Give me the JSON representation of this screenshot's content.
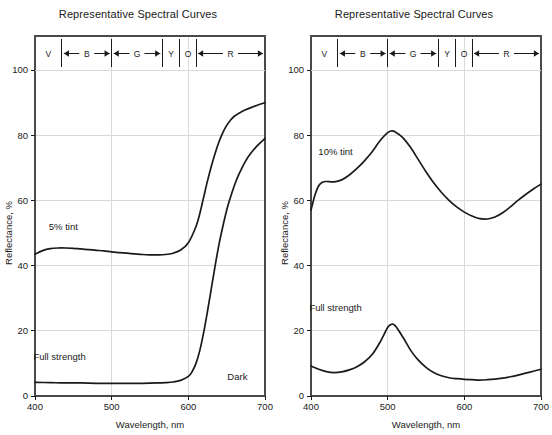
{
  "chart_data": [
    {
      "type": "line",
      "panel": "left",
      "title": "Representative Spectral Curves",
      "xlabel": "Wavelength, nm",
      "ylabel": "Reflectance, %",
      "xlim": [
        400,
        700
      ],
      "ylim": [
        0,
        100
      ],
      "xticks": [
        400,
        500,
        600,
        700
      ],
      "yticks": [
        0,
        20,
        40,
        60,
        80,
        100
      ],
      "grid": true,
      "legend_position": "inline-annotations",
      "annotations": [
        {
          "text": "5% tint",
          "x": 437,
          "y": 51
        },
        {
          "text": "Full strength",
          "x": 432,
          "y": 11
        },
        {
          "text": "Dark",
          "x": 664,
          "y": 5
        }
      ],
      "bands": [
        {
          "label": "V",
          "start": 400,
          "end": 435,
          "arrow": "right"
        },
        {
          "label": "B",
          "start": 435,
          "end": 500,
          "arrow": "both"
        },
        {
          "label": "G",
          "start": 500,
          "end": 566,
          "arrow": "both"
        },
        {
          "label": "Y",
          "start": 566,
          "end": 589,
          "arrow": "none"
        },
        {
          "label": "O",
          "start": 589,
          "end": 610,
          "arrow": "none"
        },
        {
          "label": "R",
          "start": 610,
          "end": 700,
          "arrow": "both"
        }
      ],
      "series": [
        {
          "name": "5% tint",
          "x": [
            400,
            410,
            420,
            430,
            440,
            450,
            460,
            470,
            480,
            490,
            500,
            510,
            520,
            530,
            540,
            550,
            560,
            570,
            580,
            590,
            600,
            610,
            615,
            620,
            625,
            630,
            635,
            640,
            645,
            650,
            655,
            660,
            670,
            680,
            690,
            700
          ],
          "y": [
            43.5,
            44.6,
            45.2,
            45.4,
            45.4,
            45.3,
            45.1,
            44.9,
            44.7,
            44.5,
            44.2,
            44.0,
            43.8,
            43.6,
            43.4,
            43.3,
            43.3,
            43.4,
            43.8,
            44.8,
            47.0,
            52.0,
            56.0,
            61.0,
            66.0,
            70.5,
            74.5,
            78.0,
            80.8,
            83.0,
            84.6,
            85.8,
            87.3,
            88.3,
            89.2,
            90.0
          ]
        },
        {
          "name": "Full strength",
          "x": [
            400,
            420,
            440,
            460,
            480,
            500,
            520,
            540,
            560,
            570,
            580,
            590,
            600,
            605,
            610,
            615,
            620,
            625,
            630,
            635,
            640,
            645,
            650,
            655,
            660,
            665,
            670,
            675,
            680,
            690,
            700
          ],
          "y": [
            4.2,
            4.1,
            4.0,
            4.0,
            3.9,
            3.9,
            3.9,
            3.9,
            4.0,
            4.1,
            4.3,
            4.8,
            6.0,
            7.5,
            10.0,
            14.0,
            19.5,
            26.0,
            33.0,
            40.0,
            46.5,
            52.0,
            57.0,
            61.0,
            64.5,
            67.5,
            70.0,
            72.2,
            74.0,
            76.8,
            79.0
          ]
        }
      ]
    },
    {
      "type": "line",
      "panel": "right",
      "title": "Representative Spectral Curves",
      "xlabel": "Wavelength, nm",
      "ylabel": "Reflectance, %",
      "xlim": [
        400,
        700
      ],
      "ylim": [
        0,
        100
      ],
      "xticks": [
        400,
        500,
        600,
        700
      ],
      "yticks": [
        0,
        20,
        40,
        60,
        80,
        100
      ],
      "grid": true,
      "legend_position": "inline-annotations",
      "annotations": [
        {
          "text": "10% tint",
          "x": 432,
          "y": 74
        },
        {
          "text": "Full strength",
          "x": 432,
          "y": 26
        }
      ],
      "bands": [
        {
          "label": "V",
          "start": 400,
          "end": 435,
          "arrow": "right"
        },
        {
          "label": "B",
          "start": 435,
          "end": 500,
          "arrow": "both"
        },
        {
          "label": "G",
          "start": 500,
          "end": 566,
          "arrow": "both"
        },
        {
          "label": "Y",
          "start": 566,
          "end": 589,
          "arrow": "none"
        },
        {
          "label": "O",
          "start": 589,
          "end": 610,
          "arrow": "none"
        },
        {
          "label": "R",
          "start": 610,
          "end": 700,
          "arrow": "both"
        }
      ],
      "series": [
        {
          "name": "10% tint",
          "x": [
            400,
            405,
            410,
            415,
            420,
            430,
            440,
            450,
            460,
            470,
            480,
            490,
            500,
            505,
            510,
            520,
            530,
            540,
            550,
            560,
            570,
            580,
            590,
            600,
            610,
            620,
            630,
            640,
            650,
            660,
            670,
            680,
            690,
            700
          ],
          "y": [
            57.0,
            61.5,
            64.5,
            65.6,
            65.8,
            65.7,
            66.3,
            67.8,
            69.8,
            72.2,
            75.0,
            78.3,
            80.8,
            81.3,
            81.0,
            79.2,
            76.2,
            72.5,
            68.8,
            65.4,
            62.5,
            60.0,
            58.0,
            56.4,
            55.2,
            54.4,
            54.3,
            54.9,
            56.2,
            58.0,
            60.0,
            61.8,
            63.5,
            65.0
          ]
        },
        {
          "name": "Full strength",
          "x": [
            400,
            410,
            420,
            430,
            440,
            450,
            460,
            470,
            480,
            490,
            500,
            505,
            510,
            520,
            530,
            540,
            550,
            560,
            570,
            580,
            590,
            600,
            610,
            620,
            630,
            640,
            650,
            660,
            670,
            680,
            690,
            700
          ],
          "y": [
            9.2,
            8.2,
            7.5,
            7.2,
            7.4,
            8.0,
            9.0,
            10.5,
            12.8,
            16.5,
            21.0,
            22.0,
            21.5,
            18.0,
            14.0,
            11.0,
            8.8,
            7.2,
            6.2,
            5.6,
            5.3,
            5.1,
            5.0,
            4.9,
            5.0,
            5.2,
            5.5,
            5.9,
            6.4,
            7.0,
            7.6,
            8.2
          ]
        }
      ]
    }
  ],
  "style": {
    "curve_color": "#1a1a1a",
    "grid_color": "#d9d9d9",
    "frame_color": "#4a4a4a",
    "background": "#ffffff"
  }
}
